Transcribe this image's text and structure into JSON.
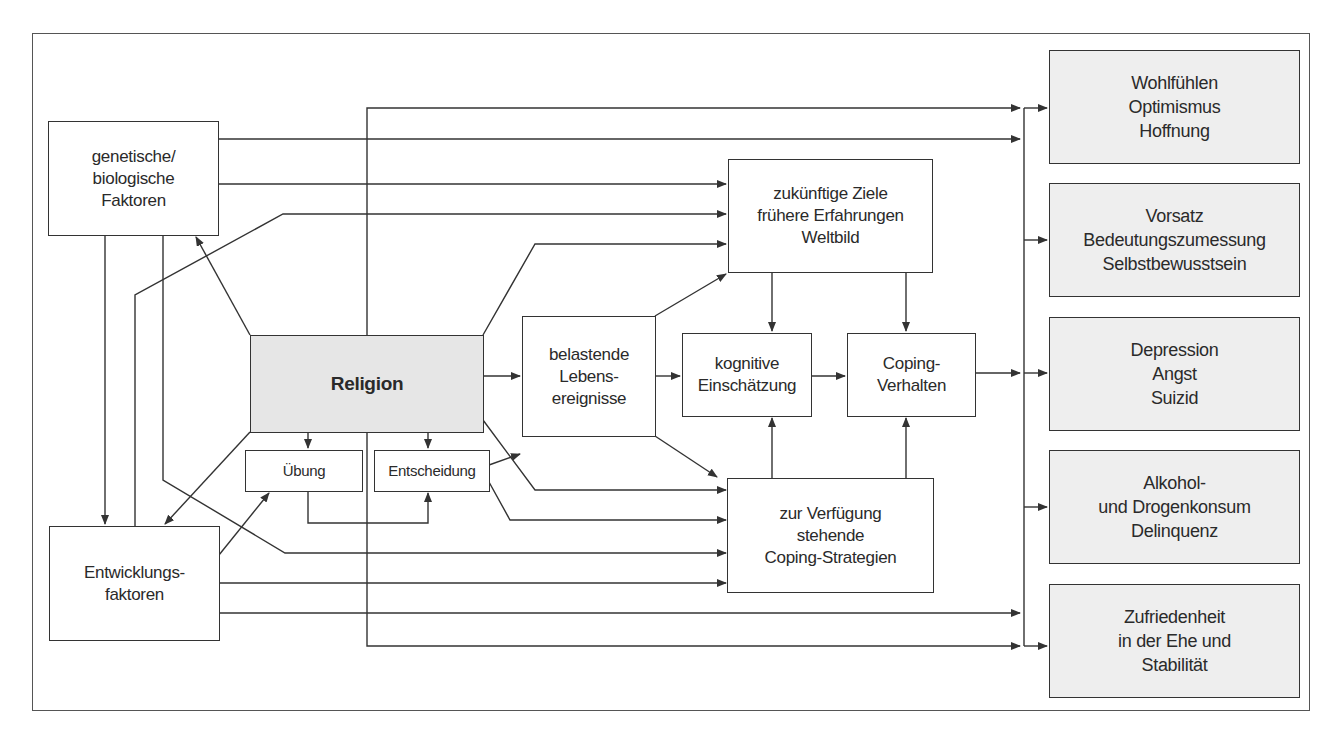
{
  "diagram": {
    "title": "",
    "nodes": {
      "genetic": {
        "lines": [
          "genetische/",
          "biologische",
          "Faktoren"
        ]
      },
      "development": {
        "lines": [
          "Entwicklungs-",
          "faktoren"
        ]
      },
      "religion": {
        "label": "Religion"
      },
      "practice": {
        "label": "Übung"
      },
      "decision": {
        "label": "Entscheidung"
      },
      "stressful_events": {
        "lines": [
          "belastende",
          "Lebens-",
          "ereignisse"
        ]
      },
      "goals": {
        "lines": [
          "zukünftige Ziele",
          "frühere Erfahrungen",
          "Weltbild"
        ]
      },
      "appraisal": {
        "lines": [
          "kognitive",
          "Einschätzung"
        ]
      },
      "coping_behavior": {
        "lines": [
          "Coping-",
          "Verhalten"
        ]
      },
      "coping_strategies": {
        "lines": [
          "zur Verfügung",
          "stehende",
          "Coping-Strategien"
        ]
      }
    },
    "outcomes": [
      {
        "lines": [
          "Wohlfühlen",
          "Optimismus",
          "Hoffnung"
        ]
      },
      {
        "lines": [
          "Vorsatz",
          "Bedeutungszumessung",
          "Selbstbewusstsein"
        ]
      },
      {
        "lines": [
          "Depression",
          "Angst",
          "Suizid"
        ]
      },
      {
        "lines": [
          "Alkohol-",
          "und Drogenkonsum",
          "Delinquenz"
        ]
      },
      {
        "lines": [
          "Zufriedenheit",
          "in der Ehe und",
          "Stabilität"
        ]
      }
    ],
    "colors": {
      "religion_fill": "#e6e6e6",
      "outcome_fill": "#eeeeee",
      "line": "#333333"
    }
  }
}
